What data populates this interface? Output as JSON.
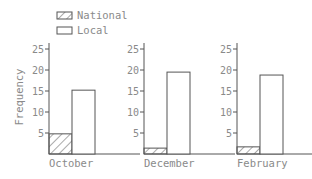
{
  "chart_data": {
    "type": "bar",
    "title": "",
    "xlabel": "",
    "ylabel": "Frequency",
    "ylim": [
      0,
      26.5
    ],
    "yticks": [
      5,
      10,
      15,
      20,
      25
    ],
    "categories": [
      "October",
      "December",
      "February"
    ],
    "series": [
      {
        "name": "National",
        "pattern": "hatch",
        "values": [
          4.8,
          1.4,
          1.7
        ]
      },
      {
        "name": "Local",
        "pattern": "none",
        "values": [
          15.2,
          19.5,
          18.8
        ]
      }
    ],
    "legend_position": "top-left",
    "grid": false,
    "layout": "small-multiples"
  },
  "colors": {
    "axis": "#555555",
    "text": "#8a8a8a",
    "bar_edge": "#555555",
    "bar_fill": "#ffffff"
  }
}
